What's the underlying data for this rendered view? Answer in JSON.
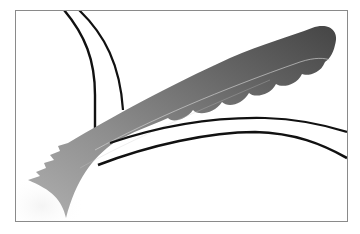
{
  "image": {
    "description": "Abstract grayscale illustration of a feather-like plume sweeping diagonally from lower-left to upper-right inside a thin rectangular frame, crossed by black arcs.",
    "frame": {
      "x": 15,
      "y": 10,
      "width": 332,
      "height": 211,
      "stroke": "#8a8a8a"
    },
    "colors": {
      "background": "#ffffff",
      "plume_dark": "#4a4a4a",
      "plume_mid": "#7a7a7a",
      "plume_light": "#a8a8a8",
      "glow": "#ececec",
      "arc": "#111111",
      "highlight_line": "#d6d6d6"
    },
    "elements": [
      {
        "name": "frame",
        "label": "Rectangular frame"
      },
      {
        "name": "plume",
        "label": "Feather-like gradient plume with scalloped lower edge"
      },
      {
        "name": "arc-upper-left-inner",
        "label": "Black arc from top edge curving down"
      },
      {
        "name": "arc-upper-left-outer",
        "label": "Second black arc from top edge"
      },
      {
        "name": "arc-lower-upper",
        "label": "Black arc crossing to right edge"
      },
      {
        "name": "arc-lower-lower",
        "label": "Lower black arc crossing to right edge"
      },
      {
        "name": "glow",
        "label": "Soft light glow at lower-left"
      }
    ]
  }
}
